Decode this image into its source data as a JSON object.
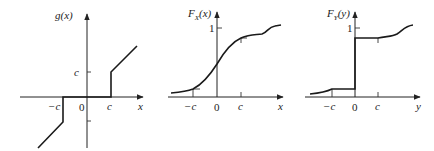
{
  "figure": {
    "panels": [
      {
        "id": "g",
        "ylabel": "g(x)",
        "xlabel": "x",
        "ticks": {
          "neg_c": "−c",
          "zero": "0",
          "c": "c",
          "y_c": "c"
        },
        "description": "Piecewise function: g(x)=0 for −c<x<c; jumps to c at x=c then increases linearly; jumps to −c at x=−c then decreases linearly"
      },
      {
        "id": "Fx",
        "ylabel": "F",
        "ylabel_sub": "X",
        "ylabel_arg": "(x)",
        "xlabel": "x",
        "ticks": {
          "neg_c": "−c",
          "zero": "0",
          "c": "c",
          "one": "1"
        },
        "description": "Continuous CDF of X rising smoothly from 0 to 1"
      },
      {
        "id": "Fy",
        "ylabel": "F",
        "ylabel_sub": "Y",
        "ylabel_arg": "(y)",
        "xlabel": "y",
        "ticks": {
          "neg_c": "−c",
          "zero": "0",
          "c": "c",
          "one": "1"
        },
        "description": "CDF of Y=g(X): flat between −c and 0, jump at 0, flat between 0 and c"
      }
    ]
  }
}
